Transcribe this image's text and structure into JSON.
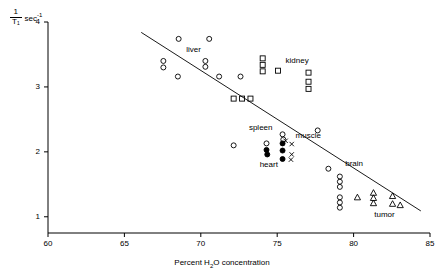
{
  "chart_data": {
    "type": "scatter",
    "title": "",
    "xlabel": "Percent H₂O concentration",
    "ylabel_numerator": "1",
    "ylabel_denominator": "T₁",
    "ylabel_unit": "sec",
    "ylabel_unit_exp": "-1",
    "xlim": [
      60,
      85
    ],
    "ylim": [
      0.75,
      4.0
    ],
    "xticks": [
      60,
      65,
      70,
      75,
      80,
      85
    ],
    "xtick_labels": [
      "60",
      "65",
      "70",
      "75",
      "80",
      "85"
    ],
    "yticks": [
      1,
      2,
      3,
      4
    ],
    "ytick_labels": [
      "1",
      "2",
      "3",
      "4"
    ],
    "grid": false,
    "legend_position": "inline-annotations",
    "trendline": {
      "label": "regression line",
      "x_start": 66.1,
      "y_start": 3.84,
      "x_end": 84.4,
      "y_end": 1.09
    },
    "series": [
      {
        "name": "liver",
        "marker": "open-circle",
        "annotation": "liver",
        "annotation_x": 69.05,
        "annotation_y": 3.57,
        "points": [
          {
            "x": 68.55,
            "y": 3.74
          },
          {
            "x": 70.55,
            "y": 3.74
          },
          {
            "x": 67.55,
            "y": 3.4
          },
          {
            "x": 67.55,
            "y": 3.3
          },
          {
            "x": 70.3,
            "y": 3.4
          },
          {
            "x": 70.3,
            "y": 3.31
          },
          {
            "x": 68.5,
            "y": 3.16
          },
          {
            "x": 71.2,
            "y": 3.16
          },
          {
            "x": 72.6,
            "y": 3.16
          }
        ]
      },
      {
        "name": "kidney",
        "marker": "open-square",
        "annotation": "kidney",
        "annotation_x": 75.55,
        "annotation_y": 3.4,
        "points": [
          {
            "x": 74.05,
            "y": 3.44
          },
          {
            "x": 74.05,
            "y": 3.34
          },
          {
            "x": 74.05,
            "y": 3.24
          },
          {
            "x": 75.05,
            "y": 3.25
          },
          {
            "x": 77.05,
            "y": 3.22
          },
          {
            "x": 77.05,
            "y": 3.08
          },
          {
            "x": 77.05,
            "y": 2.97
          },
          {
            "x": 72.15,
            "y": 2.82
          },
          {
            "x": 72.7,
            "y": 2.82
          },
          {
            "x": 73.25,
            "y": 2.82
          }
        ]
      },
      {
        "name": "spleen",
        "marker": "open-circle",
        "annotation": "spleen",
        "annotation_x": 73.15,
        "annotation_y": 2.37,
        "points": [
          {
            "x": 75.35,
            "y": 2.27
          },
          {
            "x": 75.4,
            "y": 2.19
          },
          {
            "x": 77.65,
            "y": 2.33
          },
          {
            "x": 72.15,
            "y": 2.1
          },
          {
            "x": 74.3,
            "y": 2.13
          }
        ]
      },
      {
        "name": "muscle",
        "marker": "x-cross",
        "annotation": "muscle",
        "annotation_x": 76.2,
        "annotation_y": 2.24,
        "points": [
          {
            "x": 75.55,
            "y": 2.17
          },
          {
            "x": 75.95,
            "y": 2.12
          },
          {
            "x": 75.95,
            "y": 1.96
          },
          {
            "x": 75.9,
            "y": 1.88
          }
        ]
      },
      {
        "name": "heart",
        "marker": "filled-circle",
        "annotation": "heart",
        "annotation_x": 73.85,
        "annotation_y": 1.8,
        "points": [
          {
            "x": 74.3,
            "y": 2.03
          },
          {
            "x": 74.35,
            "y": 1.96
          },
          {
            "x": 75.35,
            "y": 2.13
          },
          {
            "x": 75.35,
            "y": 2.02
          },
          {
            "x": 75.35,
            "y": 1.89
          }
        ]
      },
      {
        "name": "brain",
        "marker": "open-circle",
        "annotation": "brain",
        "annotation_x": 79.45,
        "annotation_y": 1.82,
        "points": [
          {
            "x": 78.35,
            "y": 1.74
          },
          {
            "x": 79.1,
            "y": 1.62
          },
          {
            "x": 79.1,
            "y": 1.54
          },
          {
            "x": 79.1,
            "y": 1.46
          },
          {
            "x": 79.1,
            "y": 1.3
          },
          {
            "x": 79.1,
            "y": 1.22
          },
          {
            "x": 79.1,
            "y": 1.14
          }
        ]
      },
      {
        "name": "tumor",
        "marker": "open-triangle",
        "annotation": "tumor",
        "annotation_x": 81.35,
        "annotation_y": 1.02,
        "points": [
          {
            "x": 80.25,
            "y": 1.3
          },
          {
            "x": 81.3,
            "y": 1.37
          },
          {
            "x": 81.3,
            "y": 1.29
          },
          {
            "x": 81.3,
            "y": 1.21
          },
          {
            "x": 82.55,
            "y": 1.32
          },
          {
            "x": 82.55,
            "y": 1.2
          },
          {
            "x": 83.05,
            "y": 1.18
          }
        ]
      }
    ]
  }
}
